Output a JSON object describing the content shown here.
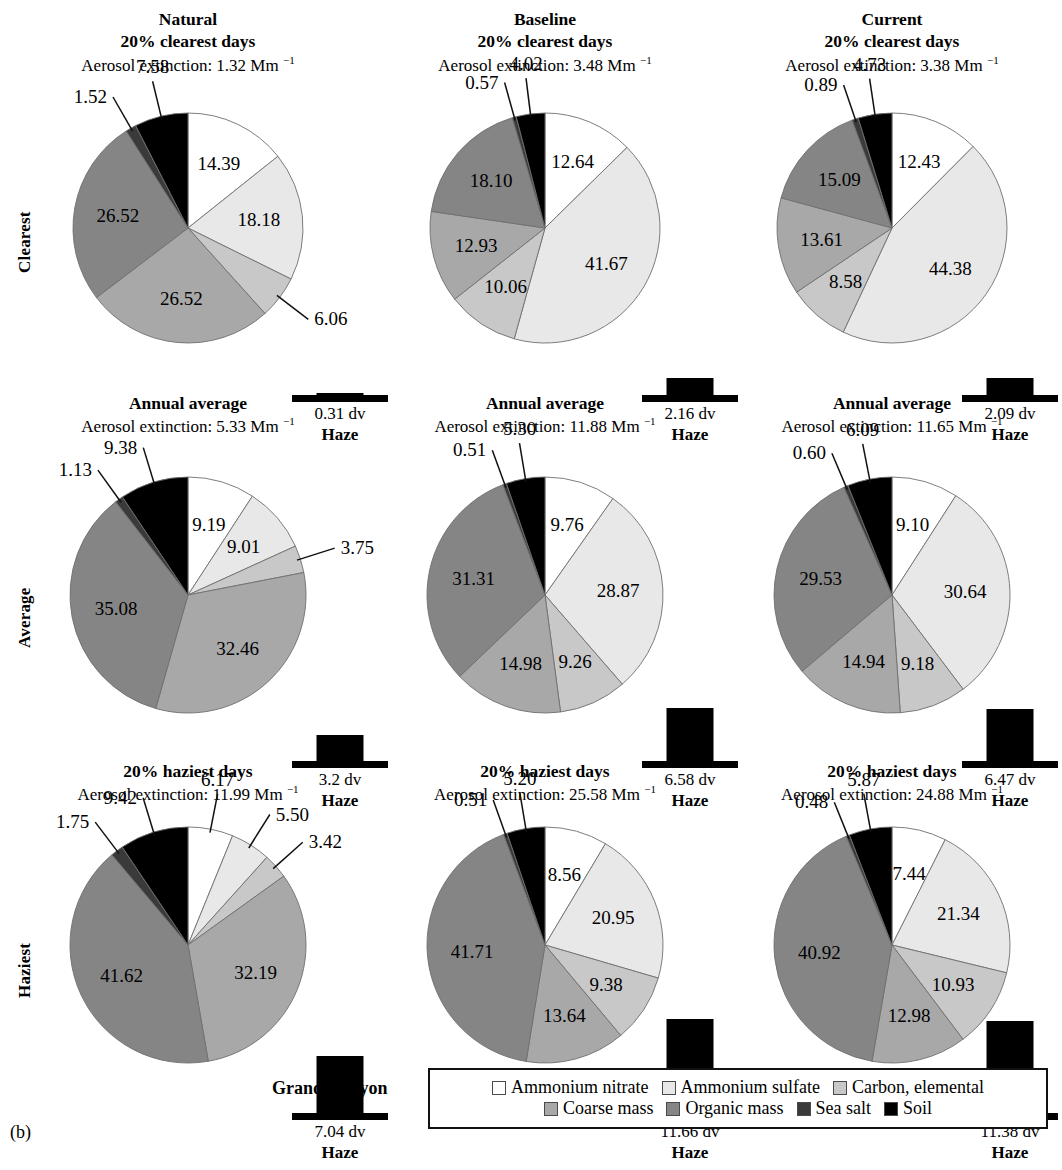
{
  "figure": {
    "caption": "(b)",
    "site_label": "Grand Canyon"
  },
  "row_labels": [
    {
      "id": "clearest",
      "label": "Clearest"
    },
    {
      "id": "average",
      "label": "Average"
    },
    {
      "id": "haziest",
      "label": "Haziest"
    }
  ],
  "column_headers": [
    "Natural",
    "Baseline",
    "Current"
  ],
  "haze_word": "Haze",
  "legend": {
    "rows": [
      [
        {
          "label": "Ammonium nitrate",
          "color": "#ffffff"
        },
        {
          "label": "Ammonium sulfate",
          "color": "#e8e8e8"
        },
        {
          "label": "Carbon, elemental",
          "color": "#c8c8c8"
        }
      ],
      [
        {
          "label": "Coarse mass",
          "color": "#a8a8a8"
        },
        {
          "label": "Organic mass",
          "color": "#858585"
        },
        {
          "label": "Sea salt",
          "color": "#3a3a3a"
        },
        {
          "label": "Soil",
          "color": "#000000"
        }
      ]
    ]
  },
  "chart_data": [
    {
      "type": "pie",
      "id": "natural-clearest",
      "column": "Natural",
      "row": "Clearest",
      "title": "Natural",
      "subtitle": "20% clearest days",
      "extinction_text": "Aerosol extinction: 1.32 Mm",
      "extinction_value": 1.32,
      "extinction_units": "Mm^-1",
      "categories": [
        "Ammonium nitrate",
        "Ammonium sulfate",
        "Carbon, elemental",
        "Coarse mass",
        "Organic mass",
        "Sea salt",
        "Soil"
      ],
      "values": [
        14.39,
        18.18,
        6.06,
        26.52,
        26.52,
        1.52,
        7.58
      ],
      "colors": [
        "#ffffff",
        "#e8e8e8",
        "#c8c8c8",
        "#a8a8a8",
        "#858585",
        "#3a3a3a",
        "#000000"
      ],
      "haze": {
        "value": "0.31 dv",
        "dv": 0.31
      }
    },
    {
      "type": "pie",
      "id": "baseline-clearest",
      "column": "Baseline",
      "row": "Clearest",
      "title": "Baseline",
      "subtitle": "20% clearest days",
      "extinction_text": "Aerosol extinction: 3.48 Mm",
      "extinction_value": 3.48,
      "extinction_units": "Mm^-1",
      "categories": [
        "Ammonium nitrate",
        "Ammonium sulfate",
        "Carbon, elemental",
        "Coarse mass",
        "Organic mass",
        "Sea salt",
        "Soil"
      ],
      "values": [
        12.64,
        41.67,
        10.06,
        12.93,
        18.1,
        0.57,
        4.02
      ],
      "colors": [
        "#ffffff",
        "#e8e8e8",
        "#c8c8c8",
        "#a8a8a8",
        "#858585",
        "#3a3a3a",
        "#000000"
      ],
      "haze": {
        "value": "2.16 dv",
        "dv": 2.16
      }
    },
    {
      "type": "pie",
      "id": "current-clearest",
      "column": "Current",
      "row": "Clearest",
      "title": "Current",
      "subtitle": "20% clearest days",
      "extinction_text": "Aerosol extinction: 3.38 Mm",
      "extinction_value": 3.38,
      "extinction_units": "Mm^-1",
      "categories": [
        "Ammonium nitrate",
        "Ammonium sulfate",
        "Carbon, elemental",
        "Coarse mass",
        "Organic mass",
        "Sea salt",
        "Soil"
      ],
      "values": [
        12.43,
        44.38,
        8.58,
        13.61,
        15.09,
        0.89,
        4.73
      ],
      "colors": [
        "#ffffff",
        "#e8e8e8",
        "#c8c8c8",
        "#a8a8a8",
        "#858585",
        "#3a3a3a",
        "#000000"
      ],
      "haze": {
        "value": "2.09 dv",
        "dv": 2.09
      }
    },
    {
      "type": "pie",
      "id": "natural-average",
      "column": "Natural",
      "row": "Average",
      "title": "",
      "subtitle": "Annual average",
      "extinction_text": "Aerosol extinction: 5.33 Mm",
      "extinction_value": 5.33,
      "extinction_units": "Mm^-1",
      "categories": [
        "Ammonium nitrate",
        "Ammonium sulfate",
        "Carbon, elemental",
        "Coarse mass",
        "Organic mass",
        "Sea salt",
        "Soil"
      ],
      "values": [
        9.19,
        9.01,
        3.75,
        32.46,
        35.08,
        1.13,
        9.38
      ],
      "colors": [
        "#ffffff",
        "#e8e8e8",
        "#c8c8c8",
        "#a8a8a8",
        "#858585",
        "#3a3a3a",
        "#000000"
      ],
      "haze": {
        "value": "3.2 dv",
        "dv": 3.2
      }
    },
    {
      "type": "pie",
      "id": "baseline-average",
      "column": "Baseline",
      "row": "Average",
      "title": "",
      "subtitle": "Annual average",
      "extinction_text": "Aerosol extinction: 11.88 Mm",
      "extinction_value": 11.88,
      "extinction_units": "Mm^-1",
      "categories": [
        "Ammonium nitrate",
        "Ammonium sulfate",
        "Carbon, elemental",
        "Coarse mass",
        "Organic mass",
        "Sea salt",
        "Soil"
      ],
      "values": [
        9.76,
        28.87,
        9.26,
        14.98,
        31.31,
        0.51,
        5.3
      ],
      "colors": [
        "#ffffff",
        "#e8e8e8",
        "#c8c8c8",
        "#a8a8a8",
        "#858585",
        "#3a3a3a",
        "#000000"
      ],
      "haze": {
        "value": "6.58 dv",
        "dv": 6.58
      }
    },
    {
      "type": "pie",
      "id": "current-average",
      "column": "Current",
      "row": "Average",
      "title": "",
      "subtitle": "Annual average",
      "extinction_text": "Aerosol extinction: 11.65 Mm",
      "extinction_value": 11.65,
      "extinction_units": "Mm^-1",
      "categories": [
        "Ammonium nitrate",
        "Ammonium sulfate",
        "Carbon, elemental",
        "Coarse mass",
        "Organic mass",
        "Sea salt",
        "Soil"
      ],
      "values": [
        9.1,
        30.64,
        9.18,
        14.94,
        29.53,
        0.6,
        6.09
      ],
      "colors": [
        "#ffffff",
        "#e8e8e8",
        "#c8c8c8",
        "#a8a8a8",
        "#858585",
        "#3a3a3a",
        "#000000"
      ],
      "haze": {
        "value": "6.47 dv",
        "dv": 6.47
      }
    },
    {
      "type": "pie",
      "id": "natural-haziest",
      "column": "Natural",
      "row": "Haziest",
      "title": "",
      "subtitle": "20% haziest days",
      "extinction_text": "Aerosol extinction: 11.99 Mm",
      "extinction_value": 11.99,
      "extinction_units": "Mm^-1",
      "categories": [
        "Ammonium nitrate",
        "Ammonium sulfate",
        "Carbon, elemental",
        "Coarse mass",
        "Organic mass",
        "Sea salt",
        "Soil"
      ],
      "values": [
        6.17,
        5.5,
        3.42,
        32.19,
        41.62,
        1.75,
        9.42
      ],
      "colors": [
        "#ffffff",
        "#e8e8e8",
        "#c8c8c8",
        "#a8a8a8",
        "#858585",
        "#3a3a3a",
        "#000000"
      ],
      "haze": {
        "value": "7.04 dv",
        "dv": 7.04
      }
    },
    {
      "type": "pie",
      "id": "baseline-haziest",
      "column": "Baseline",
      "row": "Haziest",
      "title": "",
      "subtitle": "20% haziest days",
      "extinction_text": "Aerosol extinction: 25.58 Mm",
      "extinction_value": 25.58,
      "extinction_units": "Mm^-1",
      "categories": [
        "Ammonium nitrate",
        "Ammonium sulfate",
        "Carbon, elemental",
        "Coarse mass",
        "Organic mass",
        "Sea salt",
        "Soil"
      ],
      "values": [
        8.56,
        20.95,
        9.38,
        13.64,
        41.71,
        0.51,
        5.2
      ],
      "colors": [
        "#ffffff",
        "#e8e8e8",
        "#c8c8c8",
        "#a8a8a8",
        "#858585",
        "#3a3a3a",
        "#000000"
      ],
      "haze": {
        "value": "11.66 dv",
        "dv": 11.66
      }
    },
    {
      "type": "pie",
      "id": "current-haziest",
      "column": "Current",
      "row": "Haziest",
      "title": "",
      "subtitle": "20% haziest days",
      "extinction_text": "Aerosol extinction: 24.88 Mm",
      "extinction_value": 24.88,
      "extinction_units": "Mm^-1",
      "categories": [
        "Ammonium nitrate",
        "Ammonium sulfate",
        "Carbon, elemental",
        "Coarse mass",
        "Organic mass",
        "Sea salt",
        "Soil"
      ],
      "values": [
        7.44,
        21.34,
        10.93,
        12.98,
        40.92,
        0.48,
        5.87
      ],
      "colors": [
        "#ffffff",
        "#e8e8e8",
        "#c8c8c8",
        "#a8a8a8",
        "#858585",
        "#3a3a3a",
        "#000000"
      ],
      "haze": {
        "value": "11.38 dv",
        "dv": 11.38
      }
    }
  ]
}
